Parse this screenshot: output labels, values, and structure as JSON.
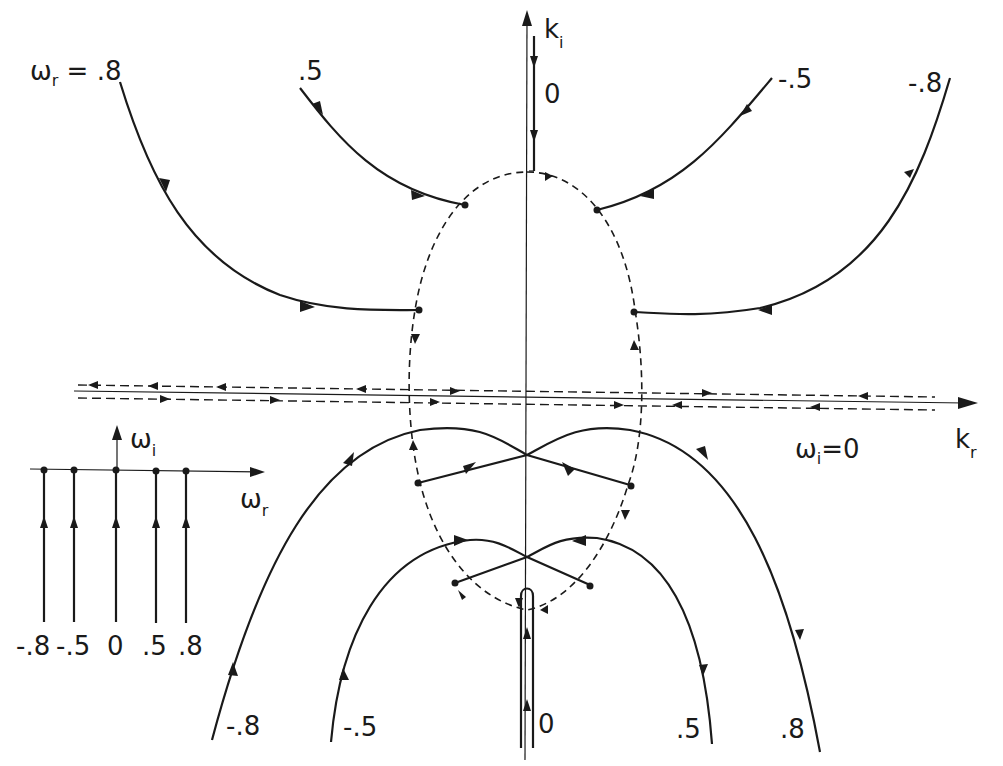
{
  "figure": {
    "axes": {
      "horizontal_label": "k",
      "horizontal_sub": "r",
      "vertical_label": "k",
      "vertical_sub": "i"
    },
    "top_curves_title_prefix": "ω",
    "top_curves_title_sub": "r",
    "top_curves_title_eq": " = .8",
    "top_labels": [
      ".5",
      "0",
      "-.5",
      "-.8"
    ],
    "bottom_labels": [
      "-.8",
      "-.5",
      "0",
      ".5",
      ".8"
    ],
    "omega_i_zero_label_prefix": "ω",
    "omega_i_zero_label_sub": "i",
    "omega_i_zero_label_eq": "=0",
    "inset": {
      "horizontal_label": "ω",
      "horizontal_sub": "r",
      "vertical_label": "ω",
      "vertical_sub": "i",
      "tick_labels": [
        "-.8",
        "-.5",
        "0",
        ".5",
        ".8"
      ]
    }
  }
}
